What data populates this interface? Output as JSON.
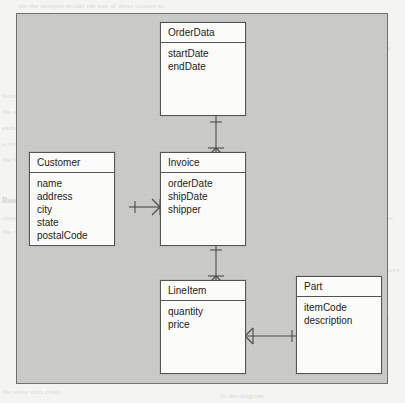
{
  "diagram": {
    "type": "entity-relationship-class-diagram",
    "notation": "crows-foot",
    "background_color": "#c9c9c7",
    "box_color": "#fbfbfa",
    "line_color": "#4a4a46",
    "classes": [
      {
        "id": "orderdata",
        "name": "OrderData",
        "attributes": [
          "startDate",
          "endDate"
        ]
      },
      {
        "id": "customer",
        "name": "Customer",
        "attributes": [
          "name",
          "address",
          "city",
          "state",
          "postalCode"
        ]
      },
      {
        "id": "invoice",
        "name": "Invoice",
        "attributes": [
          "orderDate",
          "shipDate",
          "shipper"
        ]
      },
      {
        "id": "lineitem",
        "name": "LineItem",
        "attributes": [
          "quantity",
          "price"
        ]
      },
      {
        "id": "part",
        "name": "Part",
        "attributes": [
          "itemCode",
          "description"
        ]
      }
    ],
    "relationships": [
      {
        "id": "orderdata-invoice",
        "from": "OrderData",
        "to": "Invoice",
        "from_multiplicity": "one",
        "to_multiplicity": "many",
        "orientation": "vertical"
      },
      {
        "id": "customer-invoice",
        "from": "Customer",
        "to": "Invoice",
        "from_multiplicity": "one",
        "to_multiplicity": "many",
        "orientation": "horizontal"
      },
      {
        "id": "invoice-lineitem",
        "from": "Invoice",
        "to": "LineItem",
        "from_multiplicity": "one",
        "to_multiplicity": "many",
        "orientation": "vertical"
      },
      {
        "id": "lineitem-part",
        "from": "LineItem",
        "to": "Part",
        "from_multiplicity": "many",
        "to_multiplicity": "one",
        "orientation": "horizontal"
      }
    ]
  },
  "page_bleed": {
    "lines": [
      "the the analysis model the use of these classes is",
      "consider these classes in more",
      "the relationships",
      "the data model",
      "business objects and",
      "the attributes of the",
      "each of the classes",
      "a relationship between",
      "the following diagram",
      "Book Reference: The Analysis and Design",
      "objects and the relationships between",
      "the classes defined",
      "the customer class",
      "an invoice may have",
      "many line items",
      "each line item",
      "refers to one part",
      "the order data class",
      "In the diagram"
    ]
  }
}
